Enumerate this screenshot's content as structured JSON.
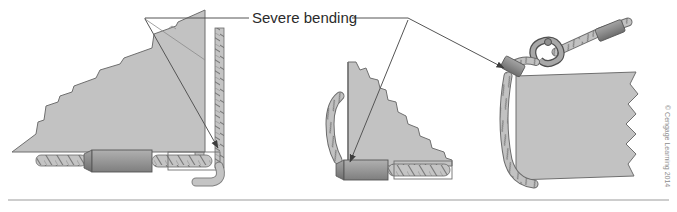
{
  "figure": {
    "name": "sling-severe-bending-illustration",
    "background_color": "#ffffff",
    "width": 677,
    "height": 212,
    "annotation": {
      "label": "Severe bending",
      "leader_left_label": "leader-line-left",
      "leader_right_label": "leader-line-right"
    },
    "credit": "© Cengage Learning 2014",
    "baseline_rule": "horizontal-rule"
  },
  "colors": {
    "load_fill": "#c2c2c2",
    "load_stroke": "#6f6f6f",
    "sleeve_fill": "#9a9a9a",
    "sleeve_stroke": "#555555",
    "ferrule_fill": "#8a8a8a",
    "rope_fill": "#bdbdbd",
    "rope_stroke": "#6b6b6b",
    "hook_fill": "#a8a8a8",
    "hook_stroke": "#4f4f4f",
    "leader_stroke": "#555555",
    "rule_stroke": "#9b9b9b",
    "label_color": "#2b2b2b",
    "credit_color": "#8d8d8d"
  },
  "panels": [
    {
      "id": "panel-left",
      "name": "left-sling-diagram",
      "description": "Large load with sling choked at corner showing severe bending",
      "load_shape_name": "load-block-left",
      "hardware": [
        {
          "name": "rope-tail-left",
          "type": "rope"
        },
        {
          "name": "ferrule-left",
          "type": "ferrule"
        },
        {
          "name": "sleeve-left",
          "type": "sleeve"
        },
        {
          "name": "rope-horizontal-left",
          "type": "rope-in-channel"
        },
        {
          "name": "rope-vertical-inner-left",
          "type": "rope"
        },
        {
          "name": "rope-vertical-outer-left",
          "type": "rope"
        }
      ]
    },
    {
      "id": "panel-middle",
      "name": "middle-sling-diagram",
      "description": "Smaller load with sling bending at bottom corner",
      "load_shape_name": "load-block-middle",
      "hardware": [
        {
          "name": "rope-loop-middle",
          "type": "rope"
        },
        {
          "name": "ferrule-middle",
          "type": "ferrule"
        },
        {
          "name": "sleeve-middle",
          "type": "sleeve"
        },
        {
          "name": "rope-horizontal-middle",
          "type": "rope-in-channel"
        }
      ]
    },
    {
      "id": "panel-right",
      "name": "right-sling-diagram",
      "description": "Load edge with shackle and rope eyes showing bending point",
      "load_shape_name": "load-block-right",
      "hardware": [
        {
          "name": "shackle-right",
          "type": "shackle"
        },
        {
          "name": "ferrule-upper-right",
          "type": "ferrule"
        },
        {
          "name": "ferrule-lower-right",
          "type": "ferrule"
        },
        {
          "name": "rope-upper-right",
          "type": "rope"
        },
        {
          "name": "rope-down-right",
          "type": "rope"
        }
      ]
    }
  ]
}
